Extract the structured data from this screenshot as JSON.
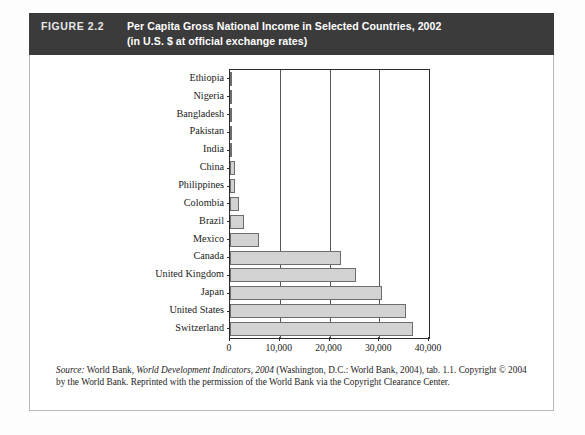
{
  "figure": {
    "label": "FIGURE 2.2",
    "title_line1": "Per Capita Gross National Income in Selected Countries, 2002",
    "title_line2": "(in U.S. $ at official exchange rates)",
    "header_bg": "#3b3b3b",
    "header_text_color": "#ffffff"
  },
  "source_note": {
    "source_word": "Source:",
    "text_before_italic": " World Bank, ",
    "italic_title": "World Development Indicators, 2004",
    "text_after_italic": " (Washington, D.C.: World Bank, 2004), tab. 1.1.",
    "line2": "Copyright © 2004 by the World Bank. Reprinted with the permission of the World Bank via the Copyright",
    "line3": "Clearance Center."
  },
  "chart_data": {
    "type": "bar",
    "orientation": "horizontal",
    "title": "Per Capita Gross National Income in Selected Countries, 2002",
    "subtitle": "(in U.S. $ at official exchange rates)",
    "xlabel": "",
    "ylabel": "",
    "xlim": [
      0,
      40000
    ],
    "xticks": [
      0,
      10000,
      20000,
      30000,
      40000
    ],
    "xtick_labels": [
      "0",
      "10,000",
      "20,000",
      "30,000",
      "40,000"
    ],
    "grid": "vertical",
    "legend": "none",
    "bar_fill": "#d2d2d2",
    "bar_stroke": "#6d6d6d",
    "categories": [
      "Ethiopia",
      "Nigeria",
      "Bangladesh",
      "Pakistan",
      "India",
      "China",
      "Philippines",
      "Colombia",
      "Brazil",
      "Mexico",
      "Canada",
      "United Kingdom",
      "Japan",
      "United States",
      "Switzerland"
    ],
    "values": [
      100,
      290,
      380,
      410,
      480,
      960,
      1020,
      1820,
      2850,
      5910,
      22300,
      25250,
      30500,
      35400,
      36700
    ],
    "units": "U.S. $"
  }
}
